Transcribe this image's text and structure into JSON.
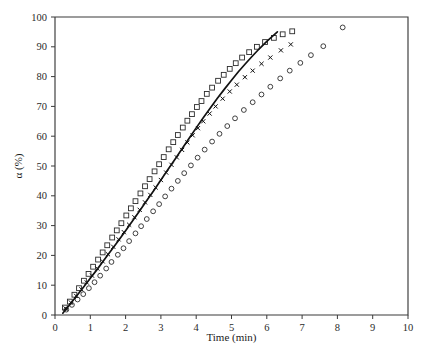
{
  "chart_data": {
    "type": "scatter",
    "title": "",
    "xlabel": "Time (min)",
    "ylabel": "α (%)",
    "xlim": [
      0,
      10
    ],
    "ylim": [
      0,
      100
    ],
    "xticks": [
      0,
      1,
      2,
      3,
      4,
      5,
      6,
      7,
      8,
      9,
      10
    ],
    "yticks": [
      0,
      10,
      20,
      30,
      40,
      50,
      60,
      70,
      80,
      90,
      100
    ],
    "xtick_labels": [
      "0",
      "1",
      "2",
      "3",
      "4",
      "5",
      "6",
      "7",
      "8",
      "9",
      "10"
    ],
    "ytick_labels": [
      "0",
      "10",
      "20",
      "30",
      "40",
      "50",
      "60",
      "70",
      "80",
      "90",
      "100"
    ],
    "grid": false,
    "legend": false,
    "legend_position": "none",
    "frame": "box",
    "series": [
      {
        "name": "open-square-series",
        "marker": "square",
        "x": [
          0.28,
          0.42,
          0.55,
          0.68,
          0.82,
          0.95,
          1.08,
          1.22,
          1.35,
          1.48,
          1.62,
          1.75,
          1.88,
          2.02,
          2.15,
          2.28,
          2.42,
          2.55,
          2.68,
          2.82,
          2.95,
          3.08,
          3.22,
          3.35,
          3.48,
          3.62,
          3.75,
          3.88,
          4.02,
          4.15,
          4.3,
          4.45,
          4.62,
          4.78,
          4.95,
          5.12,
          5.3,
          5.5,
          5.72,
          5.95,
          6.2,
          6.45,
          6.72
        ],
        "y": [
          2.5,
          4.5,
          6.8,
          9.0,
          11.5,
          13.8,
          16.2,
          18.6,
          21.0,
          23.4,
          26.0,
          28.4,
          30.8,
          33.4,
          35.8,
          38.2,
          40.8,
          43.2,
          45.6,
          48.2,
          50.6,
          53.0,
          55.6,
          58.0,
          60.4,
          62.9,
          65.2,
          67.4,
          69.8,
          71.8,
          74.2,
          76.3,
          78.6,
          80.6,
          82.6,
          84.5,
          86.4,
          88.2,
          90.0,
          91.6,
          93.0,
          94.2,
          95.2
        ]
      },
      {
        "name": "cross-series",
        "marker": "x",
        "x": [
          0.3,
          0.45,
          0.6,
          0.75,
          0.9,
          1.05,
          1.2,
          1.35,
          1.5,
          1.65,
          1.8,
          1.95,
          2.1,
          2.25,
          2.4,
          2.55,
          2.7,
          2.85,
          3.0,
          3.15,
          3.3,
          3.45,
          3.6,
          3.75,
          3.9,
          4.05,
          4.2,
          4.38,
          4.55,
          4.75,
          4.95,
          5.15,
          5.38,
          5.6,
          5.85,
          6.1,
          6.4,
          6.68
        ],
        "y": [
          2.2,
          4.2,
          6.4,
          8.6,
          10.9,
          13.2,
          15.6,
          18.0,
          20.4,
          22.9,
          25.4,
          27.8,
          30.3,
          32.8,
          35.3,
          37.8,
          40.3,
          42.8,
          45.3,
          47.8,
          50.4,
          52.9,
          55.4,
          57.9,
          60.3,
          62.7,
          65.0,
          67.6,
          70.0,
          72.6,
          75.0,
          77.3,
          79.8,
          82.0,
          84.3,
          86.4,
          88.8,
          90.8
        ]
      },
      {
        "name": "open-circle-series",
        "marker": "circle",
        "x": [
          0.32,
          0.48,
          0.64,
          0.8,
          0.96,
          1.12,
          1.28,
          1.45,
          1.6,
          1.78,
          1.94,
          2.1,
          2.28,
          2.44,
          2.6,
          2.78,
          2.95,
          3.12,
          3.3,
          3.48,
          3.66,
          3.85,
          4.04,
          4.24,
          4.45,
          4.66,
          4.88,
          5.1,
          5.35,
          5.6,
          5.85,
          6.1,
          6.38,
          6.65,
          6.95,
          7.25,
          7.6,
          8.15
        ],
        "y": [
          1.8,
          3.4,
          5.2,
          7.0,
          9.0,
          11.0,
          13.2,
          15.6,
          17.8,
          20.2,
          22.4,
          24.8,
          27.4,
          29.8,
          32.2,
          34.8,
          37.2,
          39.8,
          42.4,
          45.0,
          47.6,
          50.2,
          52.8,
          55.5,
          58.2,
          60.8,
          63.4,
          66.0,
          68.8,
          71.4,
          74.0,
          76.6,
          79.4,
          82.0,
          84.6,
          87.2,
          90.2,
          96.5
        ]
      }
    ],
    "fit_curve": {
      "name": "model-fit-curve",
      "x": [
        0.22,
        0.4,
        0.6,
        0.8,
        1.0,
        1.2,
        1.4,
        1.6,
        1.8,
        2.0,
        2.2,
        2.4,
        2.6,
        2.8,
        3.0,
        3.2,
        3.4,
        3.6,
        3.8,
        4.0,
        4.2,
        4.4,
        4.6,
        4.8,
        5.0,
        5.2,
        5.4,
        5.6,
        5.8,
        6.0,
        6.15,
        6.3
      ],
      "y": [
        0.6,
        3.2,
        6.2,
        9.2,
        12.3,
        15.4,
        18.6,
        21.8,
        25.0,
        28.3,
        31.6,
        35.0,
        38.4,
        41.8,
        45.3,
        48.8,
        52.3,
        55.8,
        59.3,
        62.8,
        66.2,
        69.5,
        72.7,
        75.8,
        78.8,
        81.7,
        84.4,
        87.0,
        89.5,
        91.8,
        93.4,
        95.0
      ]
    }
  }
}
